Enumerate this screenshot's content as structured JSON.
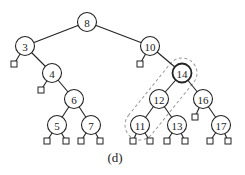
{
  "caption": "(d)",
  "tree": {
    "nodes": [
      {
        "id": "n8",
        "label": "8",
        "x": 87,
        "y": 22
      },
      {
        "id": "n3",
        "label": "3",
        "x": 25,
        "y": 46
      },
      {
        "id": "n10",
        "label": "10",
        "x": 150,
        "y": 46
      },
      {
        "id": "n4",
        "label": "4",
        "x": 52,
        "y": 73
      },
      {
        "id": "n14",
        "label": "14",
        "x": 182,
        "y": 73,
        "highlight": true
      },
      {
        "id": "n6",
        "label": "6",
        "x": 74,
        "y": 99
      },
      {
        "id": "n12",
        "label": "12",
        "x": 159,
        "y": 99
      },
      {
        "id": "n16",
        "label": "16",
        "x": 203,
        "y": 99
      },
      {
        "id": "n5",
        "label": "5",
        "x": 57,
        "y": 125
      },
      {
        "id": "n7",
        "label": "7",
        "x": 91,
        "y": 125
      },
      {
        "id": "n11",
        "label": "11",
        "x": 140,
        "y": 125
      },
      {
        "id": "n13",
        "label": "13",
        "x": 177,
        "y": 125
      },
      {
        "id": "n17",
        "label": "17",
        "x": 221,
        "y": 125
      }
    ],
    "edges": [
      [
        "n8",
        "n3"
      ],
      [
        "n8",
        "n10"
      ],
      [
        "n3",
        "n4"
      ],
      [
        "n4",
        "n6"
      ],
      [
        "n6",
        "n5"
      ],
      [
        "n6",
        "n7"
      ],
      [
        "n10",
        "n14"
      ],
      [
        "n14",
        "n12"
      ],
      [
        "n14",
        "n16"
      ],
      [
        "n12",
        "n11"
      ],
      [
        "n12",
        "n13"
      ],
      [
        "n16",
        "n17"
      ]
    ],
    "leaves": [
      {
        "parent": "n3",
        "x": 14,
        "y": 64
      },
      {
        "parent": "n4",
        "x": 41,
        "y": 90
      },
      {
        "parent": "n10",
        "x": 140,
        "y": 64
      },
      {
        "parent": "n16",
        "x": 195,
        "y": 117
      },
      {
        "parent": "n5",
        "x": 47,
        "y": 141
      },
      {
        "parent": "n5",
        "x": 66,
        "y": 141
      },
      {
        "parent": "n7",
        "x": 81,
        "y": 141
      },
      {
        "parent": "n7",
        "x": 100,
        "y": 141
      },
      {
        "parent": "n11",
        "x": 133,
        "y": 141
      },
      {
        "parent": "n11",
        "x": 150,
        "y": 141
      },
      {
        "parent": "n13",
        "x": 167,
        "y": 141
      },
      {
        "parent": "n13",
        "x": 185,
        "y": 141
      },
      {
        "parent": "n17",
        "x": 210,
        "y": 141
      },
      {
        "parent": "n17",
        "x": 228,
        "y": 141
      }
    ],
    "highlight_path": [
      "n14",
      "n12",
      "n11"
    ],
    "node_radius": 9.5
  }
}
